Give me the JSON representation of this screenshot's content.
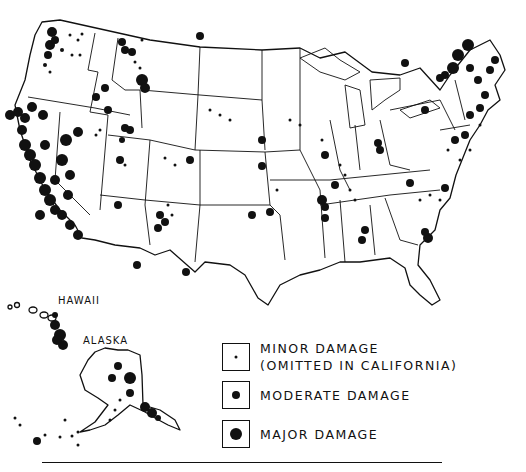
{
  "map": {
    "labels": {
      "hawaii": "HAWAII",
      "alaska": "ALASKA"
    },
    "ink_color": "#111111",
    "background": "#ffffff"
  },
  "legend": {
    "items": [
      {
        "id": "minor",
        "line1": "MINOR DAMAGE",
        "line2": "(OMITTED IN CALIFORNIA)",
        "dot_size": 3
      },
      {
        "id": "moderate",
        "line1": "MODERATE DAMAGE",
        "line2": "",
        "dot_size": 8
      },
      {
        "id": "major",
        "line1": "MAJOR DAMAGE",
        "line2": "",
        "dot_size": 12
      }
    ]
  }
}
